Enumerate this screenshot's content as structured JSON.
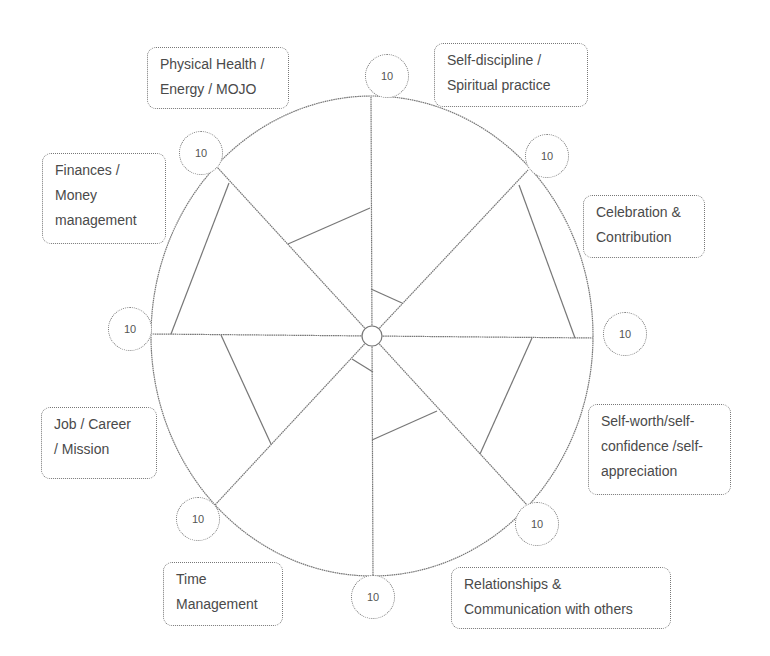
{
  "diagram": {
    "center": {
      "x": 372,
      "y": 336
    },
    "outer_radius_x": 221,
    "outer_radius_y": 240,
    "line_color": "#777777",
    "categories": [
      {
        "id": "self-discipline",
        "lines": [
          "Self-discipline /",
          "Spiritual practice"
        ],
        "max_score": "10",
        "box": {
          "x": 434,
          "y": 43,
          "w": 154,
          "h": 64
        },
        "bubble": {
          "x": 365,
          "y": 54
        }
      },
      {
        "id": "celebration",
        "lines": [
          "Celebration &",
          "Contribution"
        ],
        "max_score": "10",
        "box": {
          "x": 583,
          "y": 195,
          "w": 122,
          "h": 63
        },
        "bubble": {
          "x": 525,
          "y": 134
        }
      },
      {
        "id": "self-worth",
        "lines": [
          "Self-worth/self-",
          "confidence /self-",
          "appreciation"
        ],
        "max_score": "10",
        "box": {
          "x": 588,
          "y": 404,
          "w": 143,
          "h": 91
        },
        "bubble": {
          "x": 603,
          "y": 312
        }
      },
      {
        "id": "relationships",
        "lines": [
          "Relationships &",
          "Communication with others"
        ],
        "max_score": "10",
        "box": {
          "x": 451,
          "y": 567,
          "w": 220,
          "h": 62
        },
        "bubble": {
          "x": 515,
          "y": 502
        }
      },
      {
        "id": "time-management",
        "lines": [
          "Time",
          "Management"
        ],
        "max_score": "10",
        "box": {
          "x": 163,
          "y": 562,
          "w": 120,
          "h": 64
        },
        "bubble": {
          "x": 351,
          "y": 575
        }
      },
      {
        "id": "job-career",
        "lines": [
          "Job / Career",
          "/ Mission"
        ],
        "max_score": "10",
        "box": {
          "x": 41,
          "y": 407,
          "w": 116,
          "h": 72
        },
        "bubble": {
          "x": 176,
          "y": 497
        }
      },
      {
        "id": "finances",
        "lines": [
          "Finances /",
          "Money",
          "management"
        ],
        "max_score": "10",
        "box": {
          "x": 42,
          "y": 153,
          "w": 124,
          "h": 91
        },
        "bubble": {
          "x": 108,
          "y": 307
        }
      },
      {
        "id": "physical-health",
        "lines": [
          "Physical Health /",
          "Energy / MOJO"
        ],
        "max_score": "10",
        "box": {
          "x": 147,
          "y": 47,
          "w": 142,
          "h": 62
        },
        "bubble": {
          "x": 179,
          "y": 131
        }
      }
    ],
    "spoke_endpoints": [
      {
        "x": 371,
        "y": 97
      },
      {
        "x": 528,
        "y": 170
      },
      {
        "x": 593,
        "y": 338
      },
      {
        "x": 527,
        "y": 505
      },
      {
        "x": 373,
        "y": 576
      },
      {
        "x": 215,
        "y": 505
      },
      {
        "x": 152,
        "y": 334
      },
      {
        "x": 217,
        "y": 167
      }
    ],
    "score_segments": [
      {
        "sector": "physical-health",
        "x1": 370,
        "y1": 208,
        "x2": 288,
        "y2": 244
      },
      {
        "sector": "self-discipline",
        "x1": 371,
        "y1": 289,
        "x2": 402,
        "y2": 303
      },
      {
        "sector": "celebration",
        "x1": 519,
        "y1": 185,
        "x2": 575,
        "y2": 338
      },
      {
        "sector": "self-worth",
        "x1": 532,
        "y1": 338,
        "x2": 480,
        "y2": 454
      },
      {
        "sector": "relationships",
        "x1": 437,
        "y1": 411,
        "x2": 372,
        "y2": 440
      },
      {
        "sector": "time-management",
        "x1": 373,
        "y1": 372,
        "x2": 352,
        "y2": 359
      },
      {
        "sector": "job-career",
        "x1": 271,
        "y1": 444,
        "x2": 221,
        "y2": 335
      },
      {
        "sector": "finances",
        "x1": 171,
        "y1": 334,
        "x2": 229,
        "y2": 183
      }
    ]
  }
}
